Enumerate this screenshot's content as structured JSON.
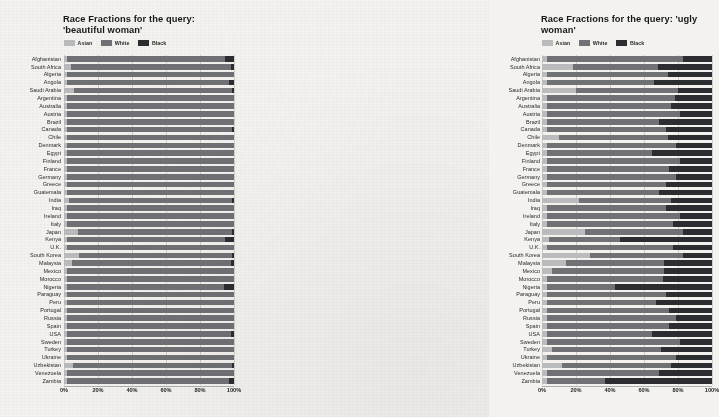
{
  "figure": {
    "background": "#f3f2ee",
    "colors": {
      "asian": "#b9bbbd",
      "white": "#6f7174",
      "black": "#2b2d30",
      "grid": "#787a7e",
      "text": "#26282a"
    }
  },
  "legend": {
    "entries": [
      {
        "label": "Asian",
        "color": "#b9bbbd"
      },
      {
        "label": "White",
        "color": "#6f7174"
      },
      {
        "label": "Black",
        "color": "#2b2d30"
      }
    ]
  },
  "xaxis": {
    "ticks": [
      "0%",
      "20%",
      "40%",
      "60%",
      "80%",
      "100%"
    ],
    "values": [
      0,
      20,
      40,
      60,
      80,
      100
    ]
  },
  "countries": [
    "Afghanistan",
    "South Africa",
    "Algeria",
    "Angola",
    "Saudi Arabia",
    "Argentina",
    "Australia",
    "Austria",
    "Brazil",
    "Canada",
    "Chile",
    "Denmark",
    "Egypt",
    "Finland",
    "France",
    "Germany",
    "Greece",
    "Guatemala",
    "India",
    "Iraq",
    "Ireland",
    "Italy",
    "Japan",
    "Kenya",
    "U.K.",
    "South Korea",
    "Malaysia",
    "Mexico",
    "Morocco",
    "Nigeria",
    "Paraguay",
    "Peru",
    "Portugal",
    "Russia",
    "Spain",
    "USA",
    "Sweden",
    "Turkey",
    "Ukraine",
    "Uzbekistan",
    "Venezuela",
    "Zambia"
  ],
  "chart_data": [
    {
      "type": "bar",
      "orientation": "horizontal",
      "stacked": true,
      "normalized": true,
      "title": "Race Fractions for the query: 'beautiful woman'",
      "xlabel": "",
      "ylabel": "",
      "xlim": [
        0,
        100
      ],
      "grid": true,
      "legend_position": "top-left",
      "categories": [
        "Afghanistan",
        "South Africa",
        "Algeria",
        "Angola",
        "Saudi Arabia",
        "Argentina",
        "Australia",
        "Austria",
        "Brazil",
        "Canada",
        "Chile",
        "Denmark",
        "Egypt",
        "Finland",
        "France",
        "Germany",
        "Greece",
        "Guatemala",
        "India",
        "Iraq",
        "Ireland",
        "Italy",
        "Japan",
        "Kenya",
        "U.K.",
        "South Korea",
        "Malaysia",
        "Mexico",
        "Morocco",
        "Nigeria",
        "Paraguay",
        "Peru",
        "Portugal",
        "Russia",
        "Spain",
        "USA",
        "Sweden",
        "Turkey",
        "Ukraine",
        "Uzbekistan",
        "Venezuela",
        "Zambia"
      ],
      "series": [
        {
          "name": "Asian",
          "color": "#b9bbbd",
          "values": [
            1.5,
            4.0,
            1.5,
            1.5,
            6.0,
            1.5,
            1.5,
            1.5,
            1.5,
            1.5,
            1.5,
            1.5,
            1.5,
            1.5,
            1.5,
            1.5,
            1.5,
            1.5,
            3.0,
            1.5,
            1.5,
            1.5,
            8.0,
            1.5,
            1.5,
            9.0,
            4.5,
            1.5,
            1.5,
            1.5,
            1.5,
            1.5,
            1.5,
            1.5,
            1.5,
            1.5,
            1.5,
            1.5,
            1.5,
            5.0,
            1.5,
            1.5
          ]
        },
        {
          "name": "White",
          "color": "#6f7174",
          "values": [
            93.5,
            94.5,
            98.5,
            95.5,
            93.0,
            98.5,
            98.5,
            98.5,
            98.5,
            97.5,
            98.5,
            98.5,
            98.5,
            98.5,
            98.5,
            98.5,
            98.5,
            98.5,
            96.0,
            98.5,
            98.5,
            98.5,
            91.0,
            93.5,
            98.5,
            90.0,
            94.0,
            98.5,
            98.5,
            92.5,
            98.5,
            98.5,
            98.5,
            98.5,
            98.5,
            96.5,
            98.5,
            98.5,
            98.5,
            94.0,
            98.5,
            95.5
          ]
        },
        {
          "name": "Black",
          "color": "#2b2d30",
          "values": [
            5.0,
            1.5,
            0.0,
            3.0,
            1.0,
            0.0,
            0.0,
            0.0,
            0.0,
            1.0,
            0.0,
            0.0,
            0.0,
            0.0,
            0.0,
            0.0,
            0.0,
            0.0,
            1.0,
            0.0,
            0.0,
            0.0,
            1.0,
            5.0,
            0.0,
            1.0,
            1.5,
            0.0,
            0.0,
            6.0,
            0.0,
            0.0,
            0.0,
            0.0,
            0.0,
            2.0,
            0.0,
            0.0,
            0.0,
            1.0,
            0.0,
            3.0
          ]
        }
      ]
    },
    {
      "type": "bar",
      "orientation": "horizontal",
      "stacked": true,
      "normalized": true,
      "title": "Race Fractions for the query: 'ugly woman'",
      "xlabel": "",
      "ylabel": "",
      "xlim": [
        0,
        100
      ],
      "grid": true,
      "legend_position": "top-left",
      "categories": [
        "Afghanistan",
        "South Africa",
        "Algeria",
        "Angola",
        "Saudi Arabia",
        "Argentina",
        "Australia",
        "Austria",
        "Brazil",
        "Canada",
        "Chile",
        "Denmark",
        "Egypt",
        "Finland",
        "France",
        "Germany",
        "Greece",
        "Guatemala",
        "India",
        "Iraq",
        "Ireland",
        "Italy",
        "Japan",
        "Kenya",
        "U.K.",
        "South Korea",
        "Malaysia",
        "Mexico",
        "Morocco",
        "Nigeria",
        "Paraguay",
        "Peru",
        "Portugal",
        "Russia",
        "Spain",
        "USA",
        "Sweden",
        "Turkey",
        "Ukraine",
        "Uzbekistan",
        "Venezuela",
        "Zambia"
      ],
      "series": [
        {
          "name": "Asian",
          "color": "#b9bbbd",
          "values": [
            3.0,
            18.0,
            3.0,
            3.0,
            20.0,
            3.0,
            3.0,
            3.0,
            3.0,
            3.0,
            10.0,
            3.0,
            3.0,
            3.0,
            3.0,
            3.0,
            3.0,
            3.0,
            22.0,
            3.0,
            3.0,
            3.0,
            25.0,
            4.0,
            3.0,
            28.0,
            14.0,
            6.0,
            3.0,
            3.0,
            3.0,
            3.0,
            3.0,
            3.0,
            3.0,
            3.0,
            3.0,
            6.0,
            3.0,
            12.0,
            3.0,
            3.0
          ]
        },
        {
          "name": "White",
          "color": "#6f7174",
          "values": [
            80.0,
            50.0,
            71.0,
            63.0,
            60.0,
            75.0,
            73.0,
            78.0,
            66.0,
            70.0,
            64.0,
            76.0,
            62.0,
            78.0,
            72.0,
            76.0,
            70.0,
            66.0,
            54.0,
            70.0,
            78.0,
            74.0,
            58.0,
            42.0,
            74.0,
            55.0,
            58.0,
            66.0,
            68.0,
            40.0,
            70.0,
            64.0,
            72.0,
            76.0,
            72.0,
            62.0,
            78.0,
            64.0,
            76.0,
            64.0,
            66.0,
            34.0
          ]
        },
        {
          "name": "Black",
          "color": "#2b2d30",
          "values": [
            17.0,
            32.0,
            26.0,
            34.0,
            20.0,
            22.0,
            24.0,
            19.0,
            31.0,
            27.0,
            26.0,
            21.0,
            35.0,
            19.0,
            25.0,
            21.0,
            27.0,
            31.0,
            24.0,
            27.0,
            19.0,
            23.0,
            17.0,
            54.0,
            23.0,
            17.0,
            28.0,
            28.0,
            29.0,
            57.0,
            27.0,
            33.0,
            25.0,
            21.0,
            25.0,
            35.0,
            19.0,
            30.0,
            21.0,
            24.0,
            31.0,
            63.0
          ]
        }
      ]
    }
  ]
}
